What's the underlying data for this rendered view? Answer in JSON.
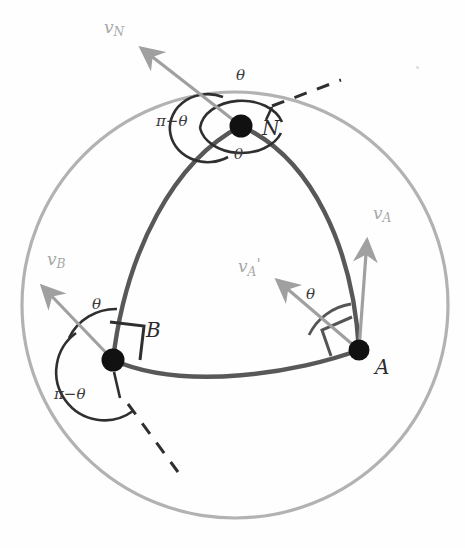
{
  "figure": {
    "type": "geometry-diagram"
  },
  "colors": {
    "outer_circle": "#b0b0b0",
    "triangle_arc": "#555555",
    "vertex_dot": "#111111",
    "vector": "#a0a0a0",
    "angle_arc": "#2f2f2f",
    "dashed": "#2f2f2f",
    "label_dark": "#2b2b2b",
    "label_light": "#a8a8a8"
  },
  "geometry": {
    "sphere": {
      "cx": 235,
      "cy": 305,
      "r": 213
    },
    "vertices": [
      {
        "id": "N",
        "x": 241,
        "y": 126,
        "r": 11
      },
      {
        "id": "B",
        "x": 113,
        "y": 360,
        "r": 11
      },
      {
        "id": "A",
        "x": 359,
        "y": 350,
        "r": 10
      }
    ]
  },
  "vertex_labels": [
    {
      "name": "label-N",
      "text": "N",
      "x": 262,
      "y": 116
    },
    {
      "name": "label-B",
      "text": "B",
      "x": 146,
      "y": 318
    },
    {
      "name": "label-A",
      "text": "A",
      "x": 375,
      "y": 355
    }
  ],
  "vectors": [
    {
      "name": "v-N",
      "base": "N",
      "label": "v",
      "sub": "N",
      "prime": "",
      "lx": 104,
      "ly": 17
    },
    {
      "name": "v-A",
      "base": "A",
      "label": "v",
      "sub": "A",
      "prime": "",
      "lx": 373,
      "ly": 203
    },
    {
      "name": "v-A-prime",
      "base": "A",
      "label": "v",
      "sub": "A",
      "prime": "'",
      "lx": 238,
      "ly": 255
    },
    {
      "name": "v-B",
      "base": "B",
      "label": "v",
      "sub": "B",
      "prime": "",
      "lx": 47,
      "ly": 249
    }
  ],
  "angle_labels": [
    {
      "name": "theta-N-top",
      "text": "θ",
      "x": 236,
      "y": 66
    },
    {
      "name": "theta-N-bottom",
      "text": "θ",
      "x": 234,
      "y": 145
    },
    {
      "name": "pi-minus-theta-N",
      "text": "π−θ",
      "x": 156,
      "y": 112
    },
    {
      "name": "theta-B",
      "text": "θ",
      "x": 92,
      "y": 295
    },
    {
      "name": "pi-minus-theta-B",
      "text": "π−θ",
      "x": 54,
      "y": 385
    },
    {
      "name": "theta-A",
      "text": "θ",
      "x": 306,
      "y": 285
    }
  ],
  "notes": {
    "dashed_from_N": "extends up-right from N",
    "dashed_from_B": "extends down-right from B",
    "right_angle_markers": [
      "at B",
      "at A"
    ]
  }
}
